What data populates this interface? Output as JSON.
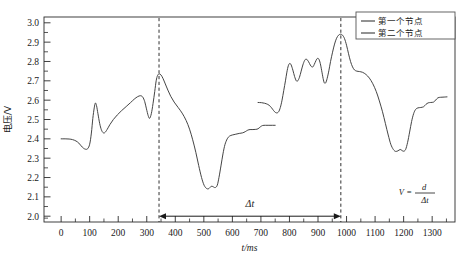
{
  "chart_data": {
    "type": "line",
    "title": "",
    "xlabel": "t/ms",
    "ylabel": "电压/V",
    "xlim": [
      -60,
      1380
    ],
    "ylim": [
      1.97,
      3.03
    ],
    "xticks": [
      0,
      100,
      200,
      300,
      400,
      500,
      600,
      700,
      800,
      900,
      1000,
      1100,
      1200,
      1300
    ],
    "xtick_labels": [
      "0",
      "100",
      "200",
      "300",
      "400",
      "500",
      "600",
      "700",
      "800",
      "900",
      "1000",
      "1100",
      "1200",
      "1300"
    ],
    "yticks": [
      2.0,
      2.1,
      2.2,
      2.3,
      2.4,
      2.5,
      2.6,
      2.7,
      2.8,
      2.9,
      3.0
    ],
    "ytick_labels": [
      "2.0",
      "2.1",
      "2.2",
      "2.3",
      "2.4",
      "2.5",
      "2.6",
      "2.7",
      "2.8",
      "2.9",
      "3.0"
    ],
    "y_minor_step": 0.05,
    "grid": false,
    "legend_position": "top-right",
    "line_color": "#3a3a3a",
    "series": [
      {
        "name": "第一个节点",
        "points": [
          [
            0,
            2.4
          ],
          [
            14,
            2.4
          ],
          [
            28,
            2.399
          ],
          [
            40,
            2.396
          ],
          [
            52,
            2.389
          ],
          [
            62,
            2.378
          ],
          [
            70,
            2.364
          ],
          [
            78,
            2.352
          ],
          [
            86,
            2.346
          ],
          [
            93,
            2.349
          ],
          [
            100,
            2.372
          ],
          [
            106,
            2.43
          ],
          [
            111,
            2.505
          ],
          [
            116,
            2.56
          ],
          [
            120,
            2.585
          ],
          [
            124,
            2.572
          ],
          [
            129,
            2.53
          ],
          [
            135,
            2.48
          ],
          [
            141,
            2.447
          ],
          [
            147,
            2.432
          ],
          [
            153,
            2.432
          ],
          [
            161,
            2.448
          ],
          [
            171,
            2.474
          ],
          [
            183,
            2.5
          ],
          [
            197,
            2.524
          ],
          [
            212,
            2.546
          ],
          [
            228,
            2.567
          ],
          [
            243,
            2.587
          ],
          [
            256,
            2.605
          ],
          [
            268,
            2.618
          ],
          [
            278,
            2.623
          ],
          [
            286,
            2.616
          ],
          [
            293,
            2.592
          ],
          [
            299,
            2.555
          ],
          [
            305,
            2.52
          ],
          [
            310,
            2.506
          ],
          [
            316,
            2.53
          ],
          [
            322,
            2.582
          ],
          [
            328,
            2.645
          ],
          [
            333,
            2.7
          ],
          [
            338,
            2.728
          ],
          [
            344,
            2.736
          ],
          [
            350,
            2.73
          ],
          [
            357,
            2.712
          ],
          [
            365,
            2.684
          ],
          [
            374,
            2.652
          ],
          [
            384,
            2.62
          ],
          [
            396,
            2.59
          ],
          [
            410,
            2.562
          ],
          [
            424,
            2.533
          ],
          [
            438,
            2.495
          ],
          [
            450,
            2.45
          ],
          [
            461,
            2.395
          ],
          [
            472,
            2.33
          ],
          [
            482,
            2.262
          ],
          [
            492,
            2.2
          ],
          [
            501,
            2.16
          ],
          [
            510,
            2.143
          ],
          [
            518,
            2.143
          ],
          [
            526,
            2.155
          ],
          [
            533,
            2.152
          ],
          [
            540,
            2.148
          ],
          [
            547,
            2.16
          ],
          [
            553,
            2.2
          ],
          [
            560,
            2.26
          ],
          [
            567,
            2.322
          ],
          [
            574,
            2.37
          ],
          [
            582,
            2.4
          ],
          [
            590,
            2.414
          ],
          [
            600,
            2.42
          ],
          [
            612,
            2.424
          ],
          [
            624,
            2.428
          ],
          [
            636,
            2.431
          ],
          [
            645,
            2.437
          ],
          [
            654,
            2.445
          ],
          [
            662,
            2.448
          ],
          [
            672,
            2.448
          ],
          [
            682,
            2.449
          ],
          [
            690,
            2.452
          ],
          [
            698,
            2.462
          ],
          [
            706,
            2.469
          ],
          [
            716,
            2.47
          ],
          [
            728,
            2.47
          ],
          [
            740,
            2.47
          ],
          [
            750,
            2.47
          ]
        ]
      },
      {
        "name": "第二个节点",
        "points": [
          [
            690,
            2.588
          ],
          [
            702,
            2.587
          ],
          [
            713,
            2.584
          ],
          [
            724,
            2.578
          ],
          [
            733,
            2.568
          ],
          [
            741,
            2.553
          ],
          [
            748,
            2.54
          ],
          [
            755,
            2.534
          ],
          [
            762,
            2.54
          ],
          [
            768,
            2.562
          ],
          [
            774,
            2.6
          ],
          [
            780,
            2.65
          ],
          [
            786,
            2.7
          ],
          [
            791,
            2.745
          ],
          [
            796,
            2.778
          ],
          [
            801,
            2.79
          ],
          [
            806,
            2.782
          ],
          [
            812,
            2.755
          ],
          [
            818,
            2.722
          ],
          [
            824,
            2.7
          ],
          [
            829,
            2.7
          ],
          [
            835,
            2.718
          ],
          [
            841,
            2.75
          ],
          [
            847,
            2.782
          ],
          [
            853,
            2.805
          ],
          [
            858,
            2.812
          ],
          [
            864,
            2.806
          ],
          [
            870,
            2.79
          ],
          [
            876,
            2.775
          ],
          [
            882,
            2.772
          ],
          [
            887,
            2.785
          ],
          [
            893,
            2.805
          ],
          [
            898,
            2.816
          ],
          [
            903,
            2.812
          ],
          [
            908,
            2.79
          ],
          [
            913,
            2.752
          ],
          [
            918,
            2.712
          ],
          [
            922,
            2.69
          ],
          [
            927,
            2.69
          ],
          [
            932,
            2.712
          ],
          [
            938,
            2.752
          ],
          [
            944,
            2.8
          ],
          [
            951,
            2.848
          ],
          [
            958,
            2.89
          ],
          [
            965,
            2.92
          ],
          [
            972,
            2.936
          ],
          [
            979,
            2.941
          ],
          [
            986,
            2.936
          ],
          [
            993,
            2.918
          ],
          [
            1000,
            2.884
          ],
          [
            1007,
            2.84
          ],
          [
            1014,
            2.8
          ],
          [
            1021,
            2.772
          ],
          [
            1028,
            2.756
          ],
          [
            1036,
            2.75
          ],
          [
            1045,
            2.748
          ],
          [
            1056,
            2.744
          ],
          [
            1068,
            2.733
          ],
          [
            1080,
            2.714
          ],
          [
            1092,
            2.685
          ],
          [
            1104,
            2.645
          ],
          [
            1115,
            2.596
          ],
          [
            1126,
            2.54
          ],
          [
            1136,
            2.48
          ],
          [
            1146,
            2.42
          ],
          [
            1155,
            2.372
          ],
          [
            1164,
            2.345
          ],
          [
            1172,
            2.335
          ],
          [
            1180,
            2.338
          ],
          [
            1188,
            2.345
          ],
          [
            1194,
            2.34
          ],
          [
            1200,
            2.336
          ],
          [
            1207,
            2.345
          ],
          [
            1214,
            2.382
          ],
          [
            1221,
            2.435
          ],
          [
            1228,
            2.49
          ],
          [
            1235,
            2.53
          ],
          [
            1242,
            2.552
          ],
          [
            1250,
            2.56
          ],
          [
            1260,
            2.562
          ],
          [
            1270,
            2.566
          ],
          [
            1278,
            2.578
          ],
          [
            1286,
            2.586
          ],
          [
            1295,
            2.588
          ],
          [
            1305,
            2.59
          ],
          [
            1312,
            2.6
          ],
          [
            1320,
            2.612
          ],
          [
            1330,
            2.615
          ],
          [
            1342,
            2.616
          ],
          [
            1352,
            2.617
          ]
        ]
      }
    ],
    "markers": {
      "dashed_lines": [
        {
          "label": "first-node-peak",
          "x": 343
        },
        {
          "label": "second-node-peak",
          "x": 980
        }
      ],
      "interval_arrow": {
        "label": "Δt",
        "x_start": 343,
        "x_end": 980,
        "y_value": 2.0
      },
      "formula": {
        "lhs": "V",
        "equals": "=",
        "numerator": "d",
        "denominator": "Δt"
      }
    }
  },
  "legend": {
    "items": [
      {
        "label": "第一个节点",
        "color": "#3a3a3a"
      },
      {
        "label": "第二个节点",
        "color": "#3a3a3a"
      }
    ]
  }
}
